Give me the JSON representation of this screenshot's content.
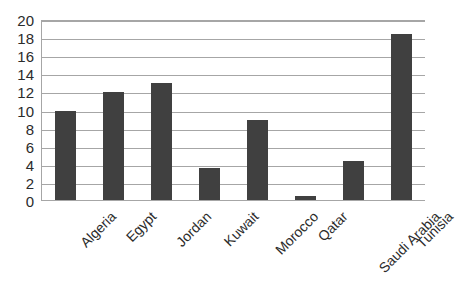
{
  "chart_data": {
    "type": "bar",
    "title": "",
    "subtitle": "",
    "xlabel": "",
    "ylabel": "",
    "categories": [
      "Algeria",
      "Egypt",
      "Jordan",
      "Kuwait",
      "Morocco",
      "Qatar",
      "Saudi Arabia",
      "Tunisia"
    ],
    "values": [
      10,
      12,
      13,
      3.7,
      9,
      0.6,
      4.4,
      18.4
    ],
    "ylim": [
      0,
      20
    ],
    "ytick_step": 2,
    "yticks": [
      20,
      18,
      16,
      14,
      12,
      10,
      8,
      6,
      4,
      2,
      0
    ],
    "grid": true,
    "grid_axis": "y",
    "legend": false,
    "legend_position": "none",
    "bar_color": "#404040",
    "grid_color": "#a6a6a6",
    "axis_color": "#a6a6a6",
    "background_color": "#ffffff",
    "text_color": "#2b2b2b",
    "xtick_rotation": -45
  }
}
